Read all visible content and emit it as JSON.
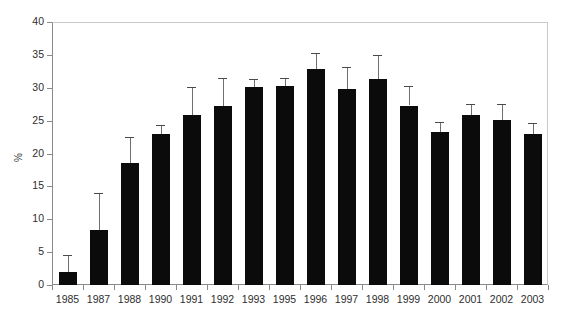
{
  "chart_data": {
    "type": "bar",
    "title": "",
    "xlabel": "",
    "ylabel": "%",
    "ylim": [
      0,
      40
    ],
    "ytick_step": 5,
    "yticks": [
      0,
      5,
      10,
      15,
      20,
      25,
      30,
      35,
      40
    ],
    "grid": false,
    "legend": "none",
    "bar_color": "#0b0b0b",
    "error_bar_color": "#6f6f6f",
    "error_bar_style": "upper-whisker-only",
    "frame_color_light": "#c9c9c9",
    "axis_color": "#8a8a8a",
    "categories": [
      "1985",
      "1987",
      "1988",
      "1990",
      "1991",
      "1992",
      "1993",
      "1995",
      "1996",
      "1997",
      "1998",
      "1999",
      "2000",
      "2001",
      "2002",
      "2003"
    ],
    "values": [
      2.0,
      8.3,
      18.6,
      23.0,
      25.9,
      27.2,
      30.1,
      30.2,
      32.8,
      29.8,
      31.4,
      27.3,
      23.2,
      25.8,
      25.1,
      22.9
    ],
    "error_upper": [
      4.5,
      14.0,
      22.5,
      24.3,
      30.1,
      31.5,
      31.3,
      31.5,
      35.3,
      33.2,
      35.0,
      30.2,
      24.8,
      27.6,
      27.5,
      24.7
    ],
    "series": [
      {
        "name": "percent",
        "values": [
          2.0,
          8.3,
          18.6,
          23.0,
          25.9,
          27.2,
          30.1,
          30.2,
          32.8,
          29.8,
          31.4,
          27.3,
          23.2,
          25.8,
          25.1,
          22.9
        ]
      }
    ]
  }
}
